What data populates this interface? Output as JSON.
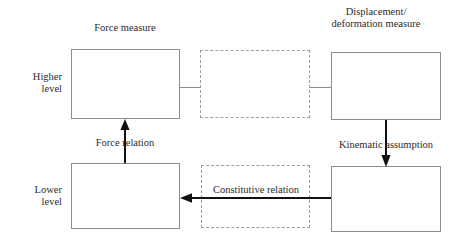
{
  "diagram": {
    "title_labels": {
      "force_measure": "Force measure",
      "displacement_line1": "Displacement/",
      "displacement_line2": "deformation measure"
    },
    "level_labels": {
      "higher_line1": "Higher",
      "higher_line2": "level",
      "lower_line1": "Lower",
      "lower_line2": "level"
    },
    "relation_labels": {
      "force_relation": "Force relation",
      "kinematic_assumption": "Kinematic assumption",
      "constitutive_relation": "Constitutive relation"
    },
    "colors": {
      "solid_box_border": "#8c8c8c",
      "dashed_box_border": "#a89b92",
      "arrow": "#111111",
      "connector": "#8c8c8c",
      "text": "#2b2b2b",
      "background": "#ffffff"
    },
    "boxes": [
      {
        "name": "higher-force-box",
        "style": "solid",
        "x": 71,
        "y": 49,
        "w": 109,
        "h": 70
      },
      {
        "name": "higher-middle-box",
        "style": "dashed",
        "x": 200,
        "y": 50,
        "w": 110,
        "h": 68
      },
      {
        "name": "higher-displacement-box",
        "style": "solid",
        "x": 331,
        "y": 52,
        "w": 110,
        "h": 68
      },
      {
        "name": "lower-force-box",
        "style": "solid",
        "x": 71,
        "y": 163,
        "w": 109,
        "h": 66
      },
      {
        "name": "lower-middle-box",
        "style": "dashed",
        "x": 201,
        "y": 165,
        "w": 109,
        "h": 63
      },
      {
        "name": "lower-displacement-box",
        "style": "solid",
        "x": 331,
        "y": 166,
        "w": 110,
        "h": 66
      }
    ]
  }
}
